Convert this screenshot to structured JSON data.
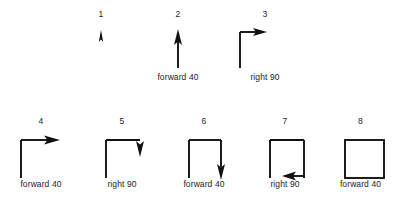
{
  "figure": {
    "ink_color": "#111111",
    "background_color": "#ffffff",
    "rows": [
      {
        "name": "top-row",
        "steps": [
          {
            "number": "1",
            "caption": "",
            "shape": "turtle-start-arrow-up",
            "description": "small turtle arrow pointing up, no line drawn"
          },
          {
            "number": "2",
            "caption": "forward 40",
            "shape": "line-up-arrow-up",
            "description": "vertical line upward with arrowhead at top"
          },
          {
            "number": "3",
            "caption": "right 90",
            "shape": "line-up-arrow-right",
            "description": "vertical line upward, turtle turned to face right"
          }
        ]
      },
      {
        "name": "bottom-row",
        "steps": [
          {
            "number": "4",
            "caption": "forward 40",
            "shape": "corner-up-right-arrow-right",
            "description": "vertical then horizontal line, arrow pointing right"
          },
          {
            "number": "5",
            "caption": "right 90",
            "shape": "corner-up-right-arrow-down",
            "description": "vertical then horizontal line, turtle turned to face down"
          },
          {
            "number": "6",
            "caption": "forward 40",
            "shape": "three-sides-arrow-down",
            "description": "three sides of square, arrow pointing down"
          },
          {
            "number": "7",
            "caption": "right 90",
            "shape": "three-sides-arrow-left",
            "description": "three sides of square, turtle turned to face left"
          },
          {
            "number": "8",
            "caption": "forward 40",
            "shape": "closed-square",
            "description": "completed closed square"
          }
        ]
      }
    ]
  }
}
